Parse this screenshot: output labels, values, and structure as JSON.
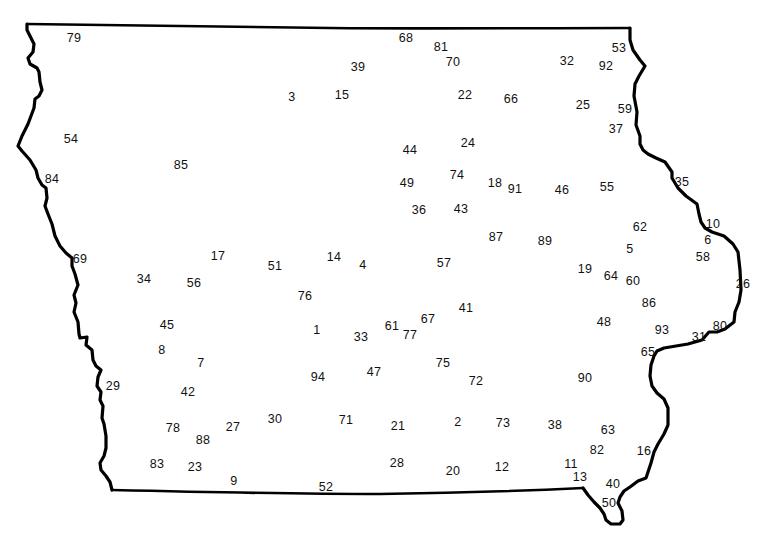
{
  "map": {
    "region": "Iowa state outline",
    "outline_color": "#000000",
    "background": "#ffffff",
    "labels": [
      {
        "text": "79",
        "x": 74,
        "y": 38
      },
      {
        "text": "68",
        "x": 406,
        "y": 38
      },
      {
        "text": "81",
        "x": 441,
        "y": 47
      },
      {
        "text": "53",
        "x": 619,
        "y": 48
      },
      {
        "text": "39",
        "x": 358,
        "y": 67
      },
      {
        "text": "70",
        "x": 453,
        "y": 62
      },
      {
        "text": "32",
        "x": 567,
        "y": 61
      },
      {
        "text": "92",
        "x": 606,
        "y": 66
      },
      {
        "text": "3",
        "x": 292,
        "y": 97
      },
      {
        "text": "15",
        "x": 342,
        "y": 95
      },
      {
        "text": "22",
        "x": 465,
        "y": 95
      },
      {
        "text": "66",
        "x": 511,
        "y": 99
      },
      {
        "text": "25",
        "x": 583,
        "y": 105
      },
      {
        "text": "59",
        "x": 625,
        "y": 109
      },
      {
        "text": "37",
        "x": 616,
        "y": 129
      },
      {
        "text": "54",
        "x": 71,
        "y": 139
      },
      {
        "text": "24",
        "x": 468,
        "y": 143
      },
      {
        "text": "44",
        "x": 410,
        "y": 150
      },
      {
        "text": "85",
        "x": 181,
        "y": 165
      },
      {
        "text": "74",
        "x": 457,
        "y": 175
      },
      {
        "text": "84",
        "x": 52,
        "y": 179
      },
      {
        "text": "49",
        "x": 407,
        "y": 183
      },
      {
        "text": "18",
        "x": 495,
        "y": 183
      },
      {
        "text": "91",
        "x": 515,
        "y": 189
      },
      {
        "text": "46",
        "x": 562,
        "y": 190
      },
      {
        "text": "55",
        "x": 607,
        "y": 187
      },
      {
        "text": "35",
        "x": 682,
        "y": 182
      },
      {
        "text": "36",
        "x": 419,
        "y": 210
      },
      {
        "text": "43",
        "x": 461,
        "y": 209
      },
      {
        "text": "62",
        "x": 640,
        "y": 227
      },
      {
        "text": "10",
        "x": 713,
        "y": 224
      },
      {
        "text": "87",
        "x": 496,
        "y": 237
      },
      {
        "text": "89",
        "x": 545,
        "y": 241
      },
      {
        "text": "6",
        "x": 708,
        "y": 240
      },
      {
        "text": "5",
        "x": 630,
        "y": 249
      },
      {
        "text": "17",
        "x": 218,
        "y": 256
      },
      {
        "text": "14",
        "x": 334,
        "y": 257
      },
      {
        "text": "58",
        "x": 703,
        "y": 257
      },
      {
        "text": "69",
        "x": 80,
        "y": 259
      },
      {
        "text": "51",
        "x": 275,
        "y": 266
      },
      {
        "text": "4",
        "x": 363,
        "y": 265
      },
      {
        "text": "57",
        "x": 444,
        "y": 263
      },
      {
        "text": "19",
        "x": 585,
        "y": 269
      },
      {
        "text": "64",
        "x": 611,
        "y": 276
      },
      {
        "text": "34",
        "x": 144,
        "y": 279
      },
      {
        "text": "60",
        "x": 633,
        "y": 281
      },
      {
        "text": "56",
        "x": 194,
        "y": 283
      },
      {
        "text": "26",
        "x": 743,
        "y": 284
      },
      {
        "text": "76",
        "x": 305,
        "y": 296
      },
      {
        "text": "86",
        "x": 649,
        "y": 303
      },
      {
        "text": "41",
        "x": 466,
        "y": 308
      },
      {
        "text": "67",
        "x": 428,
        "y": 319
      },
      {
        "text": "48",
        "x": 604,
        "y": 322
      },
      {
        "text": "45",
        "x": 167,
        "y": 325
      },
      {
        "text": "80",
        "x": 720,
        "y": 326
      },
      {
        "text": "61",
        "x": 392,
        "y": 326
      },
      {
        "text": "1",
        "x": 317,
        "y": 330
      },
      {
        "text": "93",
        "x": 662,
        "y": 330
      },
      {
        "text": "77",
        "x": 410,
        "y": 335
      },
      {
        "text": "33",
        "x": 361,
        "y": 337
      },
      {
        "text": "31",
        "x": 699,
        "y": 337
      },
      {
        "text": "8",
        "x": 162,
        "y": 350
      },
      {
        "text": "65",
        "x": 648,
        "y": 352
      },
      {
        "text": "7",
        "x": 201,
        "y": 363
      },
      {
        "text": "75",
        "x": 443,
        "y": 363
      },
      {
        "text": "47",
        "x": 374,
        "y": 372
      },
      {
        "text": "94",
        "x": 318,
        "y": 377
      },
      {
        "text": "90",
        "x": 585,
        "y": 378
      },
      {
        "text": "72",
        "x": 476,
        "y": 381
      },
      {
        "text": "29",
        "x": 113,
        "y": 386
      },
      {
        "text": "42",
        "x": 188,
        "y": 392
      },
      {
        "text": "30",
        "x": 275,
        "y": 419
      },
      {
        "text": "71",
        "x": 346,
        "y": 420
      },
      {
        "text": "2",
        "x": 458,
        "y": 422
      },
      {
        "text": "73",
        "x": 503,
        "y": 423
      },
      {
        "text": "38",
        "x": 555,
        "y": 425
      },
      {
        "text": "21",
        "x": 398,
        "y": 426
      },
      {
        "text": "27",
        "x": 233,
        "y": 427
      },
      {
        "text": "78",
        "x": 173,
        "y": 428
      },
      {
        "text": "63",
        "x": 608,
        "y": 430
      },
      {
        "text": "88",
        "x": 203,
        "y": 440
      },
      {
        "text": "82",
        "x": 597,
        "y": 450
      },
      {
        "text": "16",
        "x": 644,
        "y": 451
      },
      {
        "text": "83",
        "x": 157,
        "y": 464
      },
      {
        "text": "28",
        "x": 397,
        "y": 463
      },
      {
        "text": "11",
        "x": 571,
        "y": 464
      },
      {
        "text": "23",
        "x": 195,
        "y": 467
      },
      {
        "text": "12",
        "x": 502,
        "y": 467
      },
      {
        "text": "20",
        "x": 453,
        "y": 471
      },
      {
        "text": "13",
        "x": 580,
        "y": 477
      },
      {
        "text": "9",
        "x": 234,
        "y": 481
      },
      {
        "text": "40",
        "x": 613,
        "y": 484
      },
      {
        "text": "52",
        "x": 326,
        "y": 487
      },
      {
        "text": "50",
        "x": 609,
        "y": 503
      }
    ]
  }
}
